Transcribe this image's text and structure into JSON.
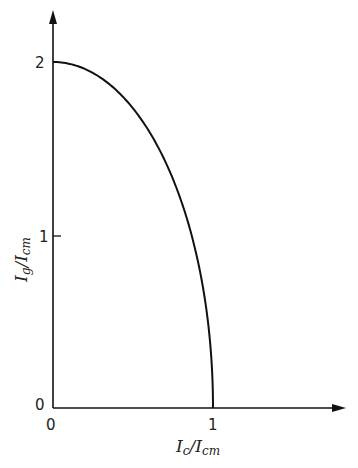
{
  "chart_data": {
    "type": "line",
    "title": "",
    "xlabel": "I_c / I_cm",
    "ylabel": "I_g / I_cm",
    "xlim": [
      0,
      1.4
    ],
    "ylim": [
      0,
      2.1
    ],
    "grid": false,
    "legend": null,
    "x_ticks": [
      {
        "value": 0,
        "label": "0"
      },
      {
        "value": 1,
        "label": "1"
      }
    ],
    "y_ticks": [
      {
        "value": 0,
        "label": "0"
      },
      {
        "value": 1,
        "label": "1"
      },
      {
        "value": 2,
        "label": "2"
      }
    ],
    "series": [
      {
        "name": "Ig/Icm vs Ic/Icm",
        "x": [
          0,
          0.1,
          0.2,
          0.3,
          0.4,
          0.5,
          0.6,
          0.7,
          0.8,
          0.9,
          0.95,
          1.0
        ],
        "y": [
          2.0,
          1.99,
          1.96,
          1.91,
          1.83,
          1.73,
          1.6,
          1.43,
          1.2,
          0.87,
          0.62,
          0.0
        ]
      }
    ]
  },
  "labels": {
    "x_axis": {
      "main": "I",
      "sub1": "c",
      "slash": "/",
      "main2": "I",
      "sub2": "cm"
    },
    "y_axis": {
      "main": "I",
      "sub1": "g",
      "slash": "/",
      "main2": "I",
      "sub2": "cm"
    },
    "x_tick_0": "0",
    "x_tick_1": "1",
    "y_tick_0": "0",
    "y_tick_1": "1",
    "y_tick_2": "2"
  },
  "colors": {
    "line": "#111111",
    "axis": "#111111"
  }
}
